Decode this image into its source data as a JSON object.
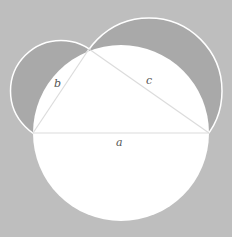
{
  "colors": {
    "background": "#bebebe",
    "lune": "#a9a9a9",
    "big_circle": "#ffffff",
    "outline": "#ffffff",
    "triangle_edge": "#dcdcdc",
    "label": "#555555"
  },
  "points": {
    "A": {
      "x": 33,
      "y": 133
    },
    "B": {
      "x": 209,
      "y": 133
    },
    "C": {
      "x": 89,
      "y": 49
    }
  },
  "circles": {
    "a": {
      "cx": 121,
      "cy": 133,
      "r": 88
    },
    "b": {
      "cx": 61,
      "cy": 91,
      "r": 50.5
    },
    "c": {
      "cx": 149,
      "cy": 91,
      "r": 73
    }
  },
  "labels": {
    "a": {
      "text": "a",
      "x": 116,
      "y": 146
    },
    "b": {
      "text": "b",
      "x": 54,
      "y": 87
    },
    "c": {
      "text": "c",
      "x": 146,
      "y": 84
    }
  }
}
